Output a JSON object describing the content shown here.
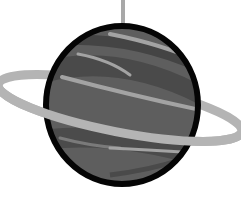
{
  "image": {
    "alt": "Grayscale hanging planet illustration with a ring",
    "width": 241,
    "height": 197
  },
  "colors": {
    "background": "#ffffff",
    "outline": "#050505",
    "planet_base": "#5e5e5e",
    "band_dark": "#474747",
    "band_light": "#a3a3a3",
    "ring": "#b4b4b4",
    "string": "#a8a8a8"
  }
}
